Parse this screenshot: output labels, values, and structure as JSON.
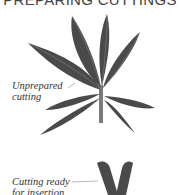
{
  "heading": "PREPARING CUTTINGS",
  "labels": {
    "unprepared_line1": "Unprepared",
    "unprepared_line2": "cutting",
    "ready_line1": "Cutting ready",
    "ready_line2": "for insertion"
  },
  "colors": {
    "leaf": "#4a4a4a",
    "leaf_vein": "#8a8a8a",
    "stem": "#7a7a7a",
    "text": "#333333",
    "background": "#ffffff"
  }
}
